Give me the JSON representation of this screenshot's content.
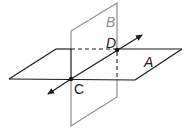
{
  "diagram": {
    "type": "intersecting-planes",
    "planes": [
      {
        "name": "A",
        "color": "#1a1a1a",
        "orientation": "horizontal"
      },
      {
        "name": "B",
        "color": "#8c8c8c",
        "orientation": "vertical"
      }
    ],
    "points": [
      {
        "name": "C",
        "color": "#1a1a1a"
      },
      {
        "name": "D",
        "color": "#1a1a1a"
      }
    ],
    "line": {
      "through": [
        "C",
        "D"
      ],
      "arrows": "both"
    },
    "labels": {
      "plane_a": "A",
      "plane_b": "B",
      "point_c": "C",
      "point_d": "D"
    }
  }
}
